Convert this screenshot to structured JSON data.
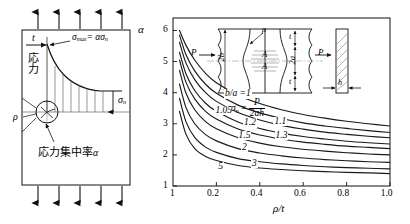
{
  "figure": {
    "line_color": "#1a1a1a",
    "text_color": "#000000"
  },
  "left_diagram": {
    "name": "stress-distribution-diagram",
    "stress_label": "応力",
    "sigma_max_label": "σmax = ασn",
    "sigma_max_plain": "σ",
    "sigma_max_sub": "max",
    "sigma_max_rhs": "= ασ",
    "sigma_max_rhs_sub": "n",
    "sigma_n_label": "σ",
    "sigma_n_sub": "n",
    "thickness_label": "t",
    "rho_label": "ρ",
    "concentration_label": "応力集中率 α",
    "concentration_text": "応力集中率",
    "concentration_symbol": "α",
    "top_arrow_count": 5,
    "bottom_arrow_count": 5
  },
  "chart_data": {
    "type": "line",
    "title": "",
    "xlabel": "ρ/t",
    "ylabel": "α",
    "xlim": [
      0.0,
      1.0
    ],
    "ylim": [
      1,
      6.4
    ],
    "grid": false,
    "legend": "inline-curve-labels",
    "xticks": [
      "0.2",
      "0.4",
      "0.6",
      "0.8",
      "1.0"
    ],
    "xtick_values": [
      0.2,
      0.4,
      0.6,
      0.8,
      1.0
    ],
    "yticks": [
      "1",
      "2",
      "3",
      "4",
      "5",
      "6"
    ],
    "ytick_values": [
      1,
      2,
      3,
      4,
      5,
      6
    ],
    "series": [
      {
        "name": "b/a = 1",
        "label": "b/a =1",
        "label_x": 0.3,
        "label_y": 3.95,
        "x": [
          0.03,
          0.06,
          0.1,
          0.15,
          0.2,
          0.3,
          0.4,
          0.5,
          0.6,
          0.7,
          0.8,
          0.9,
          1.0
        ],
        "y": [
          6.0,
          5.52,
          5.05,
          4.62,
          4.32,
          3.92,
          3.65,
          3.45,
          3.3,
          3.18,
          3.08,
          3.0,
          2.93
        ]
      },
      {
        "name": "1.05",
        "label": "1.05",
        "label_x": 0.235,
        "label_y": 3.42,
        "x": [
          0.03,
          0.06,
          0.1,
          0.15,
          0.2,
          0.3,
          0.4,
          0.5,
          0.6,
          0.7,
          0.8,
          0.9,
          1.0
        ],
        "y": [
          5.85,
          5.22,
          4.7,
          4.27,
          3.98,
          3.6,
          3.35,
          3.17,
          3.03,
          2.93,
          2.85,
          2.78,
          2.72
        ]
      },
      {
        "name": "1.1",
        "label": "1.1",
        "label_x": 0.495,
        "label_y": 3.06,
        "x": [
          0.03,
          0.06,
          0.1,
          0.15,
          0.2,
          0.3,
          0.4,
          0.5,
          0.6,
          0.7,
          0.8,
          0.9,
          1.0
        ],
        "y": [
          5.62,
          4.95,
          4.42,
          4.0,
          3.72,
          3.36,
          3.12,
          2.95,
          2.83,
          2.73,
          2.66,
          2.6,
          2.55
        ]
      },
      {
        "name": "1.2",
        "label": "1.2",
        "label_x": 0.355,
        "label_y": 3.02,
        "x": [
          0.03,
          0.06,
          0.1,
          0.15,
          0.2,
          0.3,
          0.4,
          0.5,
          0.6,
          0.7,
          0.8,
          0.9,
          1.0
        ],
        "y": [
          5.3,
          4.6,
          4.07,
          3.66,
          3.4,
          3.06,
          2.85,
          2.7,
          2.59,
          2.51,
          2.44,
          2.39,
          2.35
        ]
      },
      {
        "name": "1.3",
        "label": "1.3",
        "label_x": 0.5,
        "label_y": 2.62,
        "x": [
          0.03,
          0.06,
          0.1,
          0.15,
          0.2,
          0.3,
          0.4,
          0.5,
          0.6,
          0.7,
          0.8,
          0.9,
          1.0
        ],
        "y": [
          5.05,
          4.33,
          3.8,
          3.4,
          3.15,
          2.83,
          2.64,
          2.51,
          2.41,
          2.34,
          2.28,
          2.24,
          2.2
        ]
      },
      {
        "name": "1.5",
        "label": "1.5",
        "label_x": 0.33,
        "label_y": 2.62,
        "x": [
          0.03,
          0.06,
          0.1,
          0.15,
          0.2,
          0.3,
          0.4,
          0.5,
          0.6,
          0.7,
          0.8,
          0.9,
          1.0
        ],
        "y": [
          4.72,
          3.98,
          3.45,
          3.07,
          2.84,
          2.55,
          2.38,
          2.26,
          2.18,
          2.12,
          2.07,
          2.03,
          2.0
        ]
      },
      {
        "name": "2",
        "label": "2",
        "label_x": 0.33,
        "label_y": 2.22,
        "x": [
          0.03,
          0.06,
          0.1,
          0.15,
          0.2,
          0.3,
          0.4,
          0.5,
          0.6,
          0.7,
          0.8,
          0.9,
          1.0
        ],
        "y": [
          4.28,
          3.52,
          3.0,
          2.65,
          2.45,
          2.2,
          2.06,
          1.97,
          1.9,
          1.85,
          1.81,
          1.78,
          1.76
        ]
      },
      {
        "name": "3",
        "label": "3",
        "label_x": 0.375,
        "label_y": 1.72,
        "x": [
          0.03,
          0.06,
          0.1,
          0.15,
          0.2,
          0.3,
          0.4,
          0.5,
          0.6,
          0.7,
          0.8,
          0.9,
          1.0
        ],
        "y": [
          3.82,
          3.06,
          2.56,
          2.25,
          2.08,
          1.88,
          1.78,
          1.71,
          1.66,
          1.62,
          1.59,
          1.57,
          1.55
        ]
      },
      {
        "name": "5",
        "label": "5",
        "label_x": 0.22,
        "label_y": 1.62,
        "x": [
          0.03,
          0.06,
          0.1,
          0.15,
          0.2,
          0.3,
          0.4,
          0.5,
          0.6,
          0.7,
          0.8,
          0.9,
          1.0
        ],
        "y": [
          3.4,
          2.66,
          2.2,
          1.95,
          1.82,
          1.66,
          1.58,
          1.53,
          1.49,
          1.46,
          1.44,
          1.42,
          1.4
        ]
      }
    ]
  },
  "inset": {
    "name": "notched-plate-inset",
    "load_left": "P",
    "load_right": "P",
    "width_label": "2b",
    "height_label": "2a",
    "section_top": "A",
    "section_bottom": "A",
    "notch_radius": "ρ",
    "thickness_top": "t",
    "thickness_bottom": "t",
    "plate_thickness": "h",
    "formula_lhs": "σn",
    "formula_lhs_sym": "σ",
    "formula_lhs_sub": "n",
    "formula_eq": "=",
    "formula_num": "P",
    "formula_den": "2ah"
  }
}
